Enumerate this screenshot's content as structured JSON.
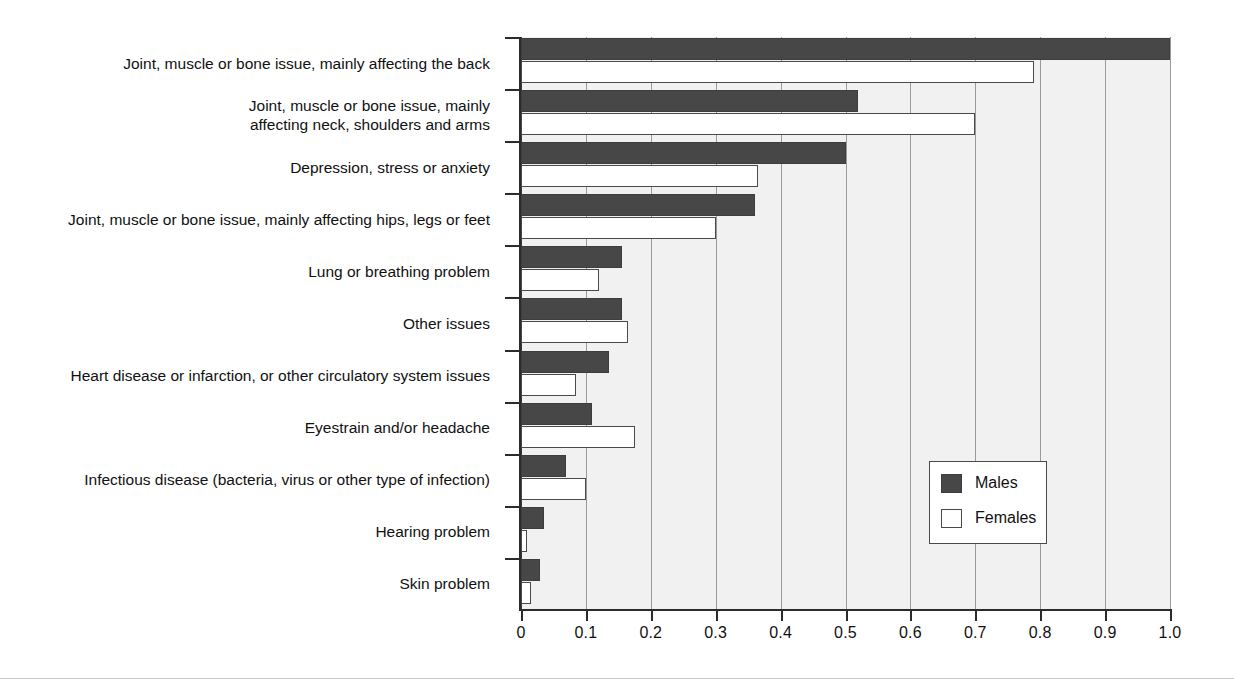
{
  "chart_data": {
    "type": "bar",
    "orientation": "horizontal",
    "title": "",
    "subtitle": "",
    "xlabel": "",
    "ylabel": "",
    "xlim": [
      0,
      1.0
    ],
    "xticks": [
      0,
      0.1,
      0.2,
      0.3,
      0.4,
      0.5,
      0.6,
      0.7,
      0.8,
      0.9,
      1.0
    ],
    "xticklabels": [
      "0",
      "0.1",
      "0.2",
      "0.3",
      "0.4",
      "0.5",
      "0.6",
      "0.7",
      "0.8",
      "0.9",
      "1.0"
    ],
    "grid": true,
    "grid_axis": "x",
    "legend_position": "center right",
    "categories": [
      "Joint, muscle or bone issue, mainly affecting the back",
      "Joint, muscle or bone issue, mainly\naffecting neck, shoulders and arms",
      "Depression, stress or anxiety",
      "Joint, muscle or bone issue, mainly affecting hips, legs or feet",
      "Lung or breathing problem",
      "Other issues",
      "Heart disease or infarction, or other circulatory system issues",
      "Eyestrain and/or headache",
      "Infectious disease (bacteria, virus or other type of infection)",
      "Hearing problem",
      "Skin problem"
    ],
    "series": [
      {
        "name": "Males",
        "color": "#474747",
        "values": [
          1.0,
          0.52,
          0.5,
          0.36,
          0.155,
          0.155,
          0.135,
          0.11,
          0.07,
          0.035,
          0.03
        ]
      },
      {
        "name": "Females",
        "color": "#ffffff",
        "values": [
          0.79,
          0.7,
          0.365,
          0.3,
          0.12,
          0.165,
          0.085,
          0.175,
          0.1,
          0.01,
          0.015
        ]
      }
    ]
  },
  "legend": {
    "entries": [
      {
        "label": "Males",
        "swatch": "filled-dark-square"
      },
      {
        "label": "Females",
        "swatch": "empty-white-square"
      }
    ]
  },
  "colors": {
    "males_bar": "#474747",
    "females_bar": "#ffffff",
    "bar_outline": "#4a4a4a",
    "plot_background": "#f1f1f1",
    "gridline": "#9a9a9a",
    "axis": "#2b2b2b",
    "text": "#111111"
  }
}
